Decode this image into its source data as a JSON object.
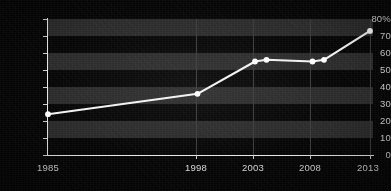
{
  "chart_data": {
    "type": "line",
    "title": "",
    "subtitle": "",
    "xlabel": "",
    "ylabel": "",
    "xlim": [
      1985,
      2013
    ],
    "ylim": [
      0,
      80
    ],
    "grid": "horizontal-bands-and-vertical-gridlines",
    "legend": "none",
    "y_ticks": [
      {
        "value": 80,
        "label": "80%"
      },
      {
        "value": 70,
        "label": "70"
      },
      {
        "value": 60,
        "label": "60"
      },
      {
        "value": 50,
        "label": "50"
      },
      {
        "value": 40,
        "label": "40"
      },
      {
        "value": 30,
        "label": "30"
      },
      {
        "value": 20,
        "label": "20"
      },
      {
        "value": 10,
        "label": "10"
      },
      {
        "value": 0,
        "label": "0"
      }
    ],
    "x_ticks": [
      {
        "value": 1985,
        "label": "1985"
      },
      {
        "value": 1998,
        "label": "1998"
      },
      {
        "value": 2003,
        "label": "2003"
      },
      {
        "value": 2008,
        "label": "2008"
      },
      {
        "value": 2013,
        "label": "2013"
      }
    ],
    "series": [
      {
        "name": "percent",
        "color": "#f2f2f2",
        "x": [
          1985,
          1998,
          2003,
          2004,
          2008,
          2009,
          2013
        ],
        "values": [
          24,
          36,
          55,
          56,
          55,
          56,
          73
        ]
      }
    ]
  },
  "colors": {
    "background": "#050505",
    "band": "#2a2a2a",
    "axis": "#e8e8e8",
    "tick_label": "#d8d8d8",
    "line": "#f2f2f2",
    "marker": "#fdfdfd",
    "gridline": "#3b3b3b"
  }
}
